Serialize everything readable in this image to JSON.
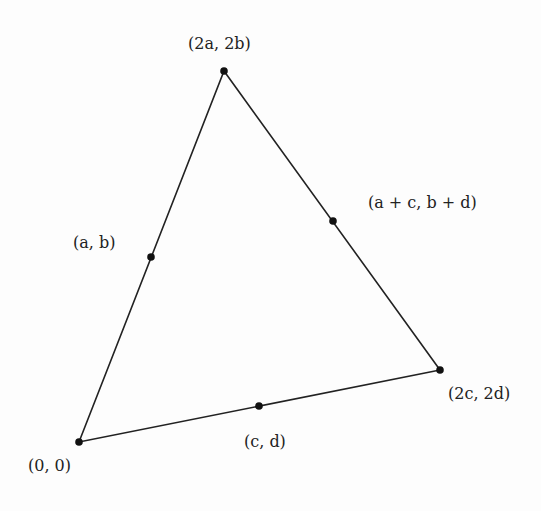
{
  "diagram": {
    "type": "triangle-midpoints",
    "vertices": [
      {
        "id": "origin",
        "label": "(0, 0)",
        "x": 79,
        "y": 442
      },
      {
        "id": "apex",
        "label": "(2a, 2b)",
        "x": 224,
        "y": 71
      },
      {
        "id": "right",
        "label": "(2c, 2d)",
        "x": 440,
        "y": 370
      }
    ],
    "midpoints": [
      {
        "id": "mid-left",
        "label": "(a, b)",
        "x": 151,
        "y": 257
      },
      {
        "id": "mid-right",
        "label": "(a + c, b + d)",
        "x": 333,
        "y": 221
      },
      {
        "id": "mid-bottom",
        "label": "(c, d)",
        "x": 259,
        "y": 406
      }
    ],
    "colors": {
      "line": "#222222",
      "point": "#111111",
      "background": "#fdfdfd"
    }
  }
}
